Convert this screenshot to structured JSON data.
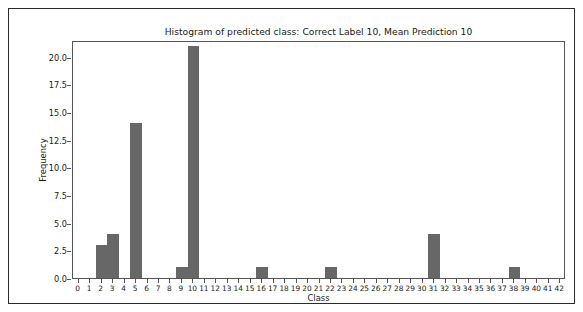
{
  "chart_data": {
    "type": "bar",
    "title": "Histogram of predicted class: Correct Label 10, Mean Prediction 10",
    "xlabel": "Class",
    "ylabel": "Frequency",
    "xlim": [
      -0.5,
      42.5
    ],
    "ylim": [
      0,
      21.5
    ],
    "grid": false,
    "legend": null,
    "bar_color": "#676767",
    "bin_width": 1,
    "categories": [
      0,
      1,
      2,
      3,
      4,
      5,
      6,
      7,
      8,
      9,
      10,
      11,
      12,
      13,
      14,
      15,
      16,
      17,
      18,
      19,
      20,
      21,
      22,
      23,
      24,
      25,
      26,
      27,
      28,
      29,
      30,
      31,
      32,
      33,
      34,
      35,
      36,
      37,
      38,
      39,
      40,
      41,
      42
    ],
    "values": [
      0,
      0,
      3,
      4,
      0,
      14,
      0,
      0,
      0,
      1,
      21,
      0,
      0,
      0,
      0,
      0,
      1,
      0,
      0,
      0,
      0,
      0,
      1,
      0,
      0,
      0,
      0,
      0,
      0,
      0,
      0,
      4,
      0,
      0,
      0,
      0,
      0,
      0,
      1,
      0,
      0,
      0,
      0
    ],
    "nonzero_bars": [
      {
        "class": 2,
        "frequency": 3
      },
      {
        "class": 3,
        "frequency": 4
      },
      {
        "class": 5,
        "frequency": 14
      },
      {
        "class": 9,
        "frequency": 1
      },
      {
        "class": 10,
        "frequency": 21
      },
      {
        "class": 16,
        "frequency": 1
      },
      {
        "class": 22,
        "frequency": 1
      },
      {
        "class": 31,
        "frequency": 4
      },
      {
        "class": 38,
        "frequency": 1
      }
    ],
    "xticks": [
      0,
      1,
      2,
      3,
      4,
      5,
      6,
      7,
      8,
      9,
      10,
      11,
      12,
      13,
      14,
      15,
      16,
      17,
      18,
      19,
      20,
      21,
      22,
      23,
      24,
      25,
      26,
      27,
      28,
      29,
      30,
      31,
      32,
      33,
      34,
      35,
      36,
      37,
      38,
      39,
      40,
      41,
      42
    ],
    "xtick_labels": [
      "0",
      "1",
      "2",
      "3",
      "4",
      "5",
      "6",
      "7",
      "8",
      "9",
      "10",
      "11",
      "12",
      "13",
      "14",
      "15",
      "16",
      "17",
      "18",
      "19",
      "20",
      "21",
      "22",
      "23",
      "24",
      "25",
      "26",
      "27",
      "28",
      "29",
      "30",
      "31",
      "32",
      "33",
      "34",
      "35",
      "36",
      "37",
      "38",
      "39",
      "40",
      "41",
      "42"
    ],
    "yticks": [
      0.0,
      2.5,
      5.0,
      7.5,
      10.0,
      12.5,
      15.0,
      17.5,
      20.0
    ],
    "ytick_labels": [
      "0.0",
      "2.5",
      "5.0",
      "7.5",
      "10.0",
      "12.5",
      "15.0",
      "17.5",
      "20.0"
    ]
  }
}
